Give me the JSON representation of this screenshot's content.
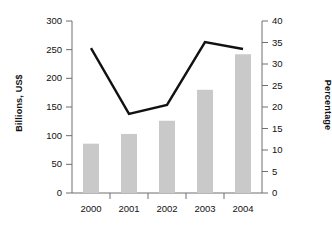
{
  "chart_data": {
    "type": "bar",
    "title": "",
    "subtitle": "",
    "categories": [
      "2000",
      "2001",
      "2002",
      "2003",
      "2004"
    ],
    "xlabel": "",
    "grid": false,
    "legend": "none",
    "annotations": [],
    "series": [
      {
        "name": "Billions, US$",
        "type": "bar",
        "axis": "left",
        "color": "#c9c9c9",
        "values": [
          86,
          103,
          126,
          180,
          242
        ]
      },
      {
        "name": "Percentage",
        "type": "line",
        "axis": "right",
        "color": "#111111",
        "values": [
          33.7,
          18.4,
          20.5,
          35.1,
          33.5
        ]
      }
    ],
    "axes": {
      "left": {
        "label": "Billions, US$",
        "ylim": [
          0,
          300
        ],
        "ticks": [
          0,
          50,
          100,
          150,
          200,
          250,
          300
        ],
        "tick_labels": [
          "0",
          "50",
          "100",
          "150",
          "200",
          "250",
          "300"
        ]
      },
      "right": {
        "label": "Percentage",
        "ylim": [
          0,
          40
        ],
        "ticks": [
          0,
          5,
          10,
          15,
          20,
          25,
          30,
          35,
          40
        ],
        "tick_labels": [
          "0",
          "5",
          "10",
          "15",
          "20",
          "25",
          "30",
          "35",
          "40"
        ]
      }
    }
  },
  "colors": {
    "bar": "#c9c9c9",
    "line": "#111111",
    "axis": "#6e6e6e",
    "text": "#111111",
    "background": "#ffffff"
  }
}
